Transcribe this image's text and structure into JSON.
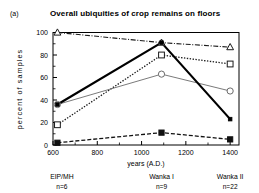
{
  "figure": {
    "panel_letter": "(a)",
    "title": "Overall ubiquities of crop remains on floors"
  },
  "chart_data": {
    "type": "line",
    "title": "Overall ubiquities of crop remains on floors",
    "xlabel": "years (A.D.)",
    "ylabel": "percent of samples",
    "xlim": [
      600,
      1440
    ],
    "ylim": [
      0,
      100
    ],
    "xticks": [
      600,
      800,
      1000,
      1200,
      1400
    ],
    "xtick_labels": [
      "600",
      "800",
      "1000",
      "1200",
      "1400"
    ],
    "yticks": [
      0,
      20,
      40,
      60,
      80,
      100
    ],
    "ytick_labels": [
      "0",
      "20",
      "40",
      "60",
      "80",
      "100"
    ],
    "grid": false,
    "legend": "none",
    "x": [
      620,
      1090,
      1400
    ],
    "series": [
      {
        "name": "series-triangle",
        "marker": "open-triangle",
        "linestyle": "dash-dot",
        "color": "#1a1a1a",
        "values": [
          100,
          91,
          87
        ]
      },
      {
        "name": "series-square",
        "marker": "open-square",
        "linestyle": "dotted",
        "color": "#1a1a1a",
        "values": [
          18,
          80,
          72
        ]
      },
      {
        "name": "series-circle",
        "marker": "open-circle",
        "linestyle": "solid-thin",
        "color": "#6b6b6b",
        "values": [
          36,
          63,
          48
        ]
      },
      {
        "name": "series-thick",
        "marker": "small-filled-square",
        "linestyle": "solid-thick",
        "color": "#000000",
        "values": [
          36,
          91,
          23
        ]
      },
      {
        "name": "series-dashed",
        "marker": "filled-square",
        "linestyle": "dashed",
        "color": "#111111",
        "values": [
          2,
          11,
          5
        ]
      }
    ],
    "groups": [
      {
        "label": "EIP/MH",
        "n": "n=6",
        "x": 640
      },
      {
        "label": "Wanka I",
        "n": "n=9",
        "x": 1090
      },
      {
        "label": "Wanka II",
        "n": "n=22",
        "x": 1400
      }
    ]
  }
}
